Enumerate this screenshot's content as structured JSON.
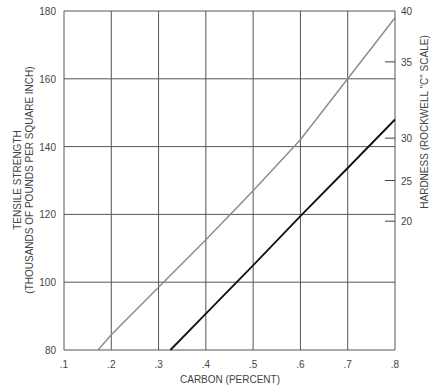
{
  "chart_data": {
    "type": "line",
    "title": "",
    "xlabel": "CARBON (PERCENT)",
    "ylabel": [
      "TENSILE STRENGTH",
      "(THOUSANDS OF POUNDS PER SQUARE INCH)"
    ],
    "y2label": "HARDNESS (ROCKWELL \"C\" SCALE)",
    "xlim": [
      0.1,
      0.8
    ],
    "ylim": [
      80,
      180
    ],
    "grid": true,
    "x_ticks": [
      ".1",
      ".2",
      ".3",
      ".4",
      ".5",
      ".6",
      ".7",
      ".8"
    ],
    "y_ticks": [
      "80",
      "100",
      "120",
      "140",
      "160",
      "180"
    ],
    "y2_ticks": [
      {
        "label": "40",
        "y": 180
      },
      {
        "label": "35",
        "y": 165
      },
      {
        "label": "30",
        "y": 142.5
      },
      {
        "label": "25",
        "y": 130
      },
      {
        "label": "20",
        "y": 118
      }
    ],
    "series": [
      {
        "name": "Tensile Strength",
        "color": "#8a8a8a",
        "x": [
          0.172,
          0.2,
          0.3,
          0.4,
          0.5,
          0.6,
          0.7,
          0.8
        ],
        "values": [
          80,
          84.5,
          98.5,
          112.5,
          127,
          142,
          160,
          178
        ]
      },
      {
        "name": "Hardness",
        "color": "#111111",
        "x": [
          0.325,
          0.4,
          0.5,
          0.6,
          0.7,
          0.8
        ],
        "values": [
          80,
          90.7,
          105,
          119.5,
          133.7,
          148
        ]
      }
    ]
  }
}
